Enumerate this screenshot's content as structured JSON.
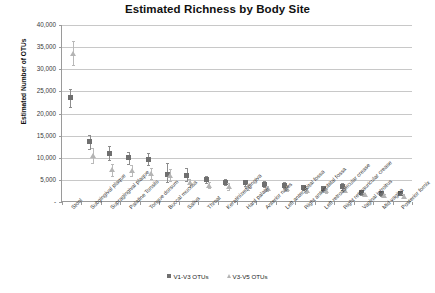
{
  "chart_data": {
    "type": "scatter",
    "title": "Estimated Richness by Body Site",
    "xlabel": "",
    "ylabel": "Estimated Number of OTUs",
    "ylim": [
      0,
      40000
    ],
    "ytick_labels": [
      "-",
      "5,000",
      "10,000",
      "15,000",
      "20,000",
      "25,000",
      "30,000",
      "35,000",
      "40,000"
    ],
    "ytick_values": [
      0,
      5000,
      10000,
      15000,
      20000,
      25000,
      30000,
      35000,
      40000
    ],
    "grid": true,
    "legend_position": "bottom",
    "categories": [
      "Stool",
      "Subgingival plaque",
      "Supragingival plaque",
      "Palatine Tonsils",
      "Tongue dorsum",
      "Buccal mucosa",
      "Saliva",
      "Throat",
      "Keratinized gingiva",
      "Hard palate",
      "Anterior nares",
      "Left antecubital fossa",
      "Right antecubital fossa",
      "Left retroauricular crease",
      "Right retroauricular crease",
      "Vaginal introitus",
      "Mid vagina",
      "Posterior fornix"
    ],
    "series": [
      {
        "name": "V1-V3 OTUs",
        "marker": "square",
        "color": "#6f6f6f",
        "values": [
          23700,
          13700,
          11000,
          10000,
          9700,
          6300,
          6100,
          5000,
          4500,
          4300,
          4000,
          3800,
          3300,
          3100,
          3500,
          2100,
          1900,
          2000
        ],
        "err_upper": [
          25600,
          15200,
          12600,
          11200,
          11000,
          8900,
          7600,
          5900,
          5300,
          5000,
          4700,
          4500,
          3900,
          3700,
          4300,
          2600,
          2500,
          2500
        ],
        "err_lower": [
          21500,
          12000,
          9400,
          8700,
          8300,
          4500,
          4700,
          4200,
          3800,
          3600,
          3300,
          3100,
          2700,
          2500,
          2800,
          1600,
          1400,
          1500
        ]
      },
      {
        "name": "V3-V5 OTUs",
        "marker": "triangle",
        "color": "#b4b4b4",
        "values": [
          33500,
          10500,
          7300,
          7100,
          6400,
          6000,
          4300,
          3800,
          3500,
          3400,
          3100,
          3000,
          2600,
          2500,
          2700,
          1700,
          1500,
          1300
        ],
        "err_upper": [
          36400,
          12200,
          8700,
          8400,
          7600,
          7400,
          5200,
          4500,
          4200,
          4000,
          3700,
          3600,
          3100,
          3000,
          3300,
          2100,
          1900,
          1700
        ],
        "err_lower": [
          31000,
          8900,
          5900,
          5800,
          5200,
          4700,
          3400,
          3100,
          2800,
          2700,
          2500,
          2400,
          2100,
          2000,
          2200,
          1300,
          1100,
          900
        ]
      }
    ]
  },
  "legend": {
    "items": [
      {
        "label": "V1-V3 OTUs"
      },
      {
        "label": "V3-V5 OTUs"
      }
    ]
  }
}
